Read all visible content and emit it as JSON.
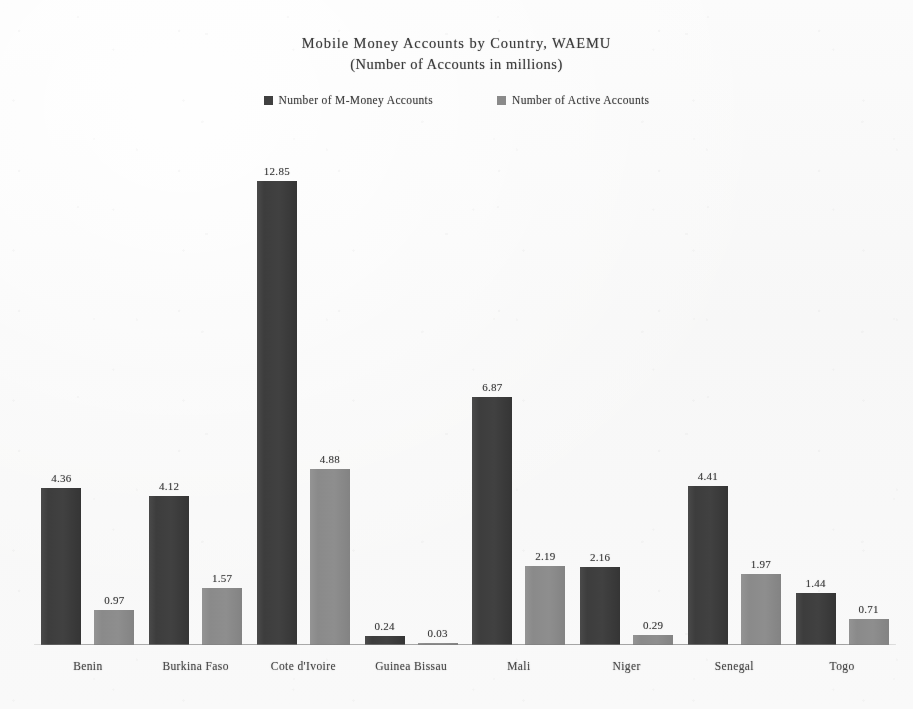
{
  "chart_data": {
    "type": "bar",
    "title": "Mobile Money Accounts by Country, WAEMU",
    "subtitle": "(Number of Accounts in millions)",
    "xlabel": "",
    "ylabel": "",
    "ylim": [
      0,
      13.5
    ],
    "grid": false,
    "legend_position": "top-center",
    "categories": [
      "Benin",
      "Burkina Faso",
      "Cote d'Ivoire",
      "Guinea Bissau",
      "Mali",
      "Niger",
      "Senegal",
      "Togo"
    ],
    "series": [
      {
        "name": "Number of M-Money Accounts",
        "color": "#404040",
        "values": [
          4.36,
          4.12,
          12.85,
          0.24,
          6.87,
          2.16,
          4.41,
          1.44
        ]
      },
      {
        "name": "Number of Active Accounts",
        "color": "#8a8a8a",
        "values": [
          0.97,
          1.57,
          4.88,
          0.03,
          2.19,
          0.29,
          1.97,
          0.71
        ]
      }
    ]
  },
  "legend": {
    "entries": [
      {
        "label": "Number of M-Money Accounts",
        "color": "#404040"
      },
      {
        "label": "Number of Active Accounts",
        "color": "#8a8a8a"
      }
    ]
  }
}
